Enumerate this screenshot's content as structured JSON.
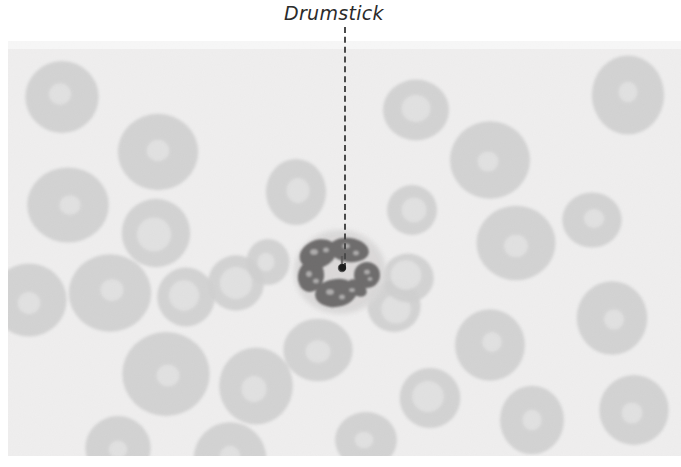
{
  "figure": {
    "kind": "photomicrograph",
    "palette": {
      "page_background": "#ffffff",
      "slide_background": "#ebeaea",
      "erythrocyte_fill": "#c3c3c3",
      "erythrocyte_pallor": "#dcdcdc",
      "neutrophil_cytoplasm": "#cfcdcd",
      "nucleus_dark": "#3d3b3b",
      "label_color": "#2b2b2b",
      "leader_line_color": "#4a4a4a"
    },
    "plate": {
      "x": 8,
      "y": 41,
      "width": 673,
      "height": 415
    }
  },
  "annotation": {
    "label": "Drumstick",
    "label_style": "italic",
    "leader": {
      "style": "dashed",
      "from_x": 345,
      "from_y": 27,
      "to_x": 345,
      "to_y": 268,
      "endpoint_marker": "dot"
    }
  },
  "cells": {
    "neutrophil": {
      "center_x": 340,
      "center_y": 272,
      "radius": 46,
      "nucleus_lobes": 4,
      "drumstick_x": 342,
      "drumstick_y": 268
    },
    "erythrocytes": [
      {
        "cx": 62,
        "cy": 97,
        "r": 39,
        "pallor": 0.3
      },
      {
        "cx": 158,
        "cy": 152,
        "r": 41,
        "pallor": 0.28
      },
      {
        "cx": 68,
        "cy": 205,
        "r": 40,
        "pallor": 0.26
      },
      {
        "cx": 156,
        "cy": 233,
        "r": 36,
        "pallor": 0.5
      },
      {
        "cx": 29,
        "cy": 300,
        "r": 38,
        "pallor": 0.3
      },
      {
        "cx": 110,
        "cy": 293,
        "r": 40,
        "pallor": 0.28
      },
      {
        "cx": 186,
        "cy": 297,
        "r": 30,
        "pallor": 0.52
      },
      {
        "cx": 236,
        "cy": 283,
        "r": 28,
        "pallor": 0.58
      },
      {
        "cx": 166,
        "cy": 374,
        "r": 42,
        "pallor": 0.26
      },
      {
        "cx": 256,
        "cy": 386,
        "r": 38,
        "pallor": 0.34
      },
      {
        "cx": 230,
        "cy": 459,
        "r": 36,
        "pallor": 0.28
      },
      {
        "cx": 296,
        "cy": 192,
        "r": 32,
        "pallor": 0.38
      },
      {
        "cx": 268,
        "cy": 262,
        "r": 22,
        "pallor": 0.4
      },
      {
        "cx": 318,
        "cy": 350,
        "r": 34,
        "pallor": 0.36
      },
      {
        "cx": 394,
        "cy": 306,
        "r": 28,
        "pallor": 0.55
      },
      {
        "cx": 408,
        "cy": 278,
        "r": 26,
        "pallor": 0.6
      },
      {
        "cx": 416,
        "cy": 110,
        "r": 32,
        "pallor": 0.44
      },
      {
        "cx": 412,
        "cy": 210,
        "r": 26,
        "pallor": 0.5
      },
      {
        "cx": 490,
        "cy": 160,
        "r": 40,
        "pallor": 0.26
      },
      {
        "cx": 516,
        "cy": 243,
        "r": 38,
        "pallor": 0.3
      },
      {
        "cx": 490,
        "cy": 345,
        "r": 36,
        "pallor": 0.28
      },
      {
        "cx": 430,
        "cy": 398,
        "r": 30,
        "pallor": 0.52
      },
      {
        "cx": 532,
        "cy": 420,
        "r": 34,
        "pallor": 0.3
      },
      {
        "cx": 612,
        "cy": 318,
        "r": 36,
        "pallor": 0.28
      },
      {
        "cx": 634,
        "cy": 410,
        "r": 34,
        "pallor": 0.3
      },
      {
        "cx": 628,
        "cy": 95,
        "r": 38,
        "pallor": 0.26
      },
      {
        "cx": 592,
        "cy": 220,
        "r": 30,
        "pallor": 0.34
      },
      {
        "cx": 366,
        "cy": 440,
        "r": 30,
        "pallor": 0.3
      },
      {
        "cx": 118,
        "cy": 448,
        "r": 34,
        "pallor": 0.28
      }
    ]
  }
}
